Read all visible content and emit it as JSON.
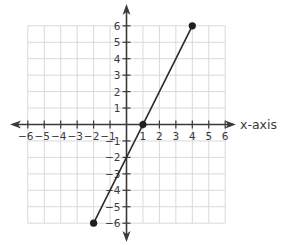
{
  "chart_data": {
    "type": "line",
    "title": "",
    "xlabel": "x-axis",
    "ylabel": "",
    "xlim": [
      -6,
      6
    ],
    "ylim": [
      -6,
      6
    ],
    "grid": true,
    "x_ticks": [
      -6,
      -5,
      -4,
      -3,
      -2,
      -1,
      1,
      2,
      3,
      4,
      5,
      6
    ],
    "y_ticks": [
      -6,
      -5,
      -4,
      -3,
      -2,
      -1,
      1,
      2,
      3,
      4,
      5,
      6
    ],
    "tick_labels": {
      "x": [
        "−6",
        "−5",
        "−4",
        "−3",
        "−2",
        "−1",
        "1",
        "2",
        "3",
        "4",
        "5",
        "6"
      ],
      "y": [
        "−6",
        "−5",
        "−4",
        "−3",
        "−2",
        "−1",
        "1",
        "2",
        "3",
        "4",
        "5",
        "6"
      ]
    },
    "series": [
      {
        "name": "segment",
        "x": [
          -2,
          4
        ],
        "y": [
          -6,
          6
        ]
      }
    ],
    "points": [
      {
        "x": -2,
        "y": -6
      },
      {
        "x": 1,
        "y": 0
      },
      {
        "x": 4,
        "y": 6
      }
    ],
    "colors": {
      "grid": "#d9d9d9",
      "axis": "#3a3a3a",
      "line": "#2b2b2b",
      "point": "#1f1f1f"
    }
  }
}
